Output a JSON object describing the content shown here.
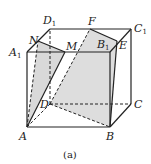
{
  "figure": {
    "caption": "(a)",
    "shape": "cube",
    "colors": {
      "stroke": "#222222",
      "shade": "#d9d9d9",
      "background": "#ffffff"
    }
  },
  "points": {
    "A": {
      "label": "A",
      "sub": "",
      "x": 27,
      "y": 127
    },
    "B": {
      "label": "B",
      "sub": "",
      "x": 110,
      "y": 127
    },
    "C": {
      "label": "C",
      "sub": "",
      "x": 131,
      "y": 104
    },
    "D": {
      "label": "D",
      "sub": "",
      "x": 50,
      "y": 104
    },
    "A1": {
      "label": "A",
      "sub": "1",
      "x": 27,
      "y": 52
    },
    "B1": {
      "label": "B",
      "sub": "1",
      "x": 110,
      "y": 52
    },
    "C1": {
      "label": "C",
      "sub": "1",
      "x": 131,
      "y": 29
    },
    "D1": {
      "label": "D",
      "sub": "1",
      "x": 50,
      "y": 29
    },
    "N": {
      "label": "N",
      "sub": "",
      "x": 38,
      "y": 41
    },
    "M": {
      "label": "M",
      "sub": "",
      "x": 65,
      "y": 52
    },
    "F": {
      "label": "F",
      "sub": "",
      "x": 90,
      "y": 29
    },
    "E": {
      "label": "E",
      "sub": "",
      "x": 117,
      "y": 41
    }
  },
  "shaded_regions": [
    "A-N-M",
    "D-F-E-B"
  ],
  "edges_solid": [
    "A-B",
    "A-A1",
    "A1-B1",
    "B-B1",
    "B-C",
    "C-C1",
    "C1-D1",
    "D1-A1",
    "B1-C1",
    "N-M",
    "F-E",
    "A-M",
    "E-B"
  ],
  "edges_dashed": [
    "A-D",
    "D-C",
    "D-D1",
    "A-N",
    "D-F",
    "D-B"
  ]
}
